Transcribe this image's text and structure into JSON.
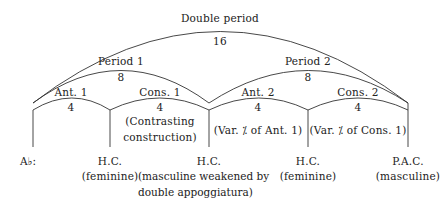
{
  "diagram": {
    "title": "Double period",
    "total_measures": "16",
    "periods": [
      {
        "label": "Period 1",
        "measures": "8",
        "phrases": [
          {
            "label": "Ant. 1",
            "measures": "4",
            "note": ""
          },
          {
            "label": "Cons. 1",
            "measures": "4",
            "note_line1": "(Contrasting",
            "note_line2": "construction)"
          }
        ]
      },
      {
        "label": "Period 2",
        "measures": "8",
        "phrases": [
          {
            "label": "Ant. 2",
            "measures": "4",
            "note": "(Var. ⁒ of Ant. 1)"
          },
          {
            "label": "Cons. 2",
            "measures": "4",
            "note": "(Var. ⁒ of Cons. 1)"
          }
        ]
      }
    ],
    "key": "A♭:",
    "cadences": [
      {
        "name": "H.C.",
        "line2": "(feminine)"
      },
      {
        "name": "H.C.",
        "line2": "(masculine weakened by",
        "line3": "double appoggiatura)"
      },
      {
        "name": "H.C.",
        "line2": "(feminine)"
      },
      {
        "name": "P.A.C.",
        "line2": "(masculine)"
      }
    ],
    "colors": {
      "line": "#333333",
      "text": "#222222"
    }
  }
}
